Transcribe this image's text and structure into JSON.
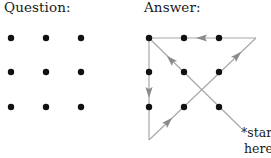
{
  "question": {
    "title": "Question:",
    "dots": [
      {
        "x": 11,
        "y": 38
      },
      {
        "x": 46,
        "y": 38
      },
      {
        "x": 81,
        "y": 38
      },
      {
        "x": 11,
        "y": 72
      },
      {
        "x": 46,
        "y": 72
      },
      {
        "x": 81,
        "y": 72
      },
      {
        "x": 11,
        "y": 107
      },
      {
        "x": 46,
        "y": 107
      },
      {
        "x": 81,
        "y": 107
      }
    ]
  },
  "answer": {
    "title": "Answer:",
    "dots": [
      {
        "x": 149,
        "y": 38
      },
      {
        "x": 184,
        "y": 38
      },
      {
        "x": 219,
        "y": 38
      },
      {
        "x": 149,
        "y": 72
      },
      {
        "x": 184,
        "y": 72
      },
      {
        "x": 219,
        "y": 72
      },
      {
        "x": 149,
        "y": 107
      },
      {
        "x": 184,
        "y": 107
      },
      {
        "x": 219,
        "y": 107
      }
    ],
    "path_segments": [
      {
        "from": [
          241,
          128
        ],
        "to": [
          149,
          38
        ],
        "arrow_at": [
          171,
          60
        ],
        "direction": "up-left"
      },
      {
        "from": [
          149,
          38
        ],
        "to": [
          149,
          140
        ],
        "arrow_at": [
          149,
          92
        ],
        "direction": "down"
      },
      {
        "from": [
          149,
          140
        ],
        "to": [
          256,
          38
        ],
        "arrow_at": [
          168,
          122
        ],
        "direction": "up-right"
      },
      {
        "from": [
          256,
          38
        ],
        "to": [
          149,
          38
        ],
        "arrow_at": [
          202,
          38
        ],
        "direction": "left"
      }
    ],
    "extra_arrow": {
      "at": [
        237,
        56
      ],
      "direction": "up-right"
    },
    "start_label": "*start",
    "here_label": "here"
  },
  "colors": {
    "dot": "#111111",
    "line": "#a8a8a8",
    "arrow": "#8a8a8a",
    "text": "#1a1a1a"
  },
  "caption": {
    "text": "",
    "note": "bottom caption line is clipped at image edge; glyphs unreadable"
  }
}
